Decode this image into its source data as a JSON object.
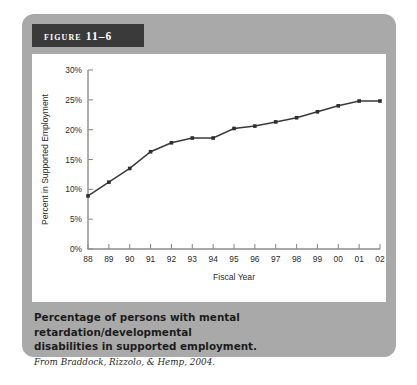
{
  "figure": {
    "banner_label": "Figure 11–6",
    "caption_line1": "Percentage of persons with mental retardation/developmental",
    "caption_line2": "disabilities in supported employment.",
    "source": "From Braddock, Rizzolo, & Hemp, 2004."
  },
  "colors": {
    "panel": "#a9a9a9",
    "banner": "#3a3a3a",
    "plot_background": "#ffffff",
    "axis": "#8d8d8d",
    "line": "#3a3a3a",
    "marker": "#2e2e2e"
  },
  "chart_data": {
    "type": "line",
    "title": "",
    "xlabel": "Fiscal Year",
    "ylabel": "Percent in Supported Employment",
    "categories": [
      "88",
      "89",
      "90",
      "91",
      "92",
      "93",
      "94",
      "95",
      "96",
      "97",
      "98",
      "99",
      "00",
      "01",
      "02"
    ],
    "values": [
      8.9,
      11.2,
      13.5,
      16.3,
      17.8,
      18.6,
      18.6,
      20.2,
      20.6,
      21.3,
      22.0,
      23.0,
      24.0,
      24.8,
      24.8
    ],
    "ylim": [
      0,
      30
    ],
    "ytick_values": [
      0,
      5,
      10,
      15,
      20,
      25,
      30
    ],
    "ytick_labels": [
      "0%",
      "5%",
      "10%",
      "15%",
      "20%",
      "25%",
      "30%"
    ],
    "grid": false,
    "legend": "none",
    "markers": true
  }
}
